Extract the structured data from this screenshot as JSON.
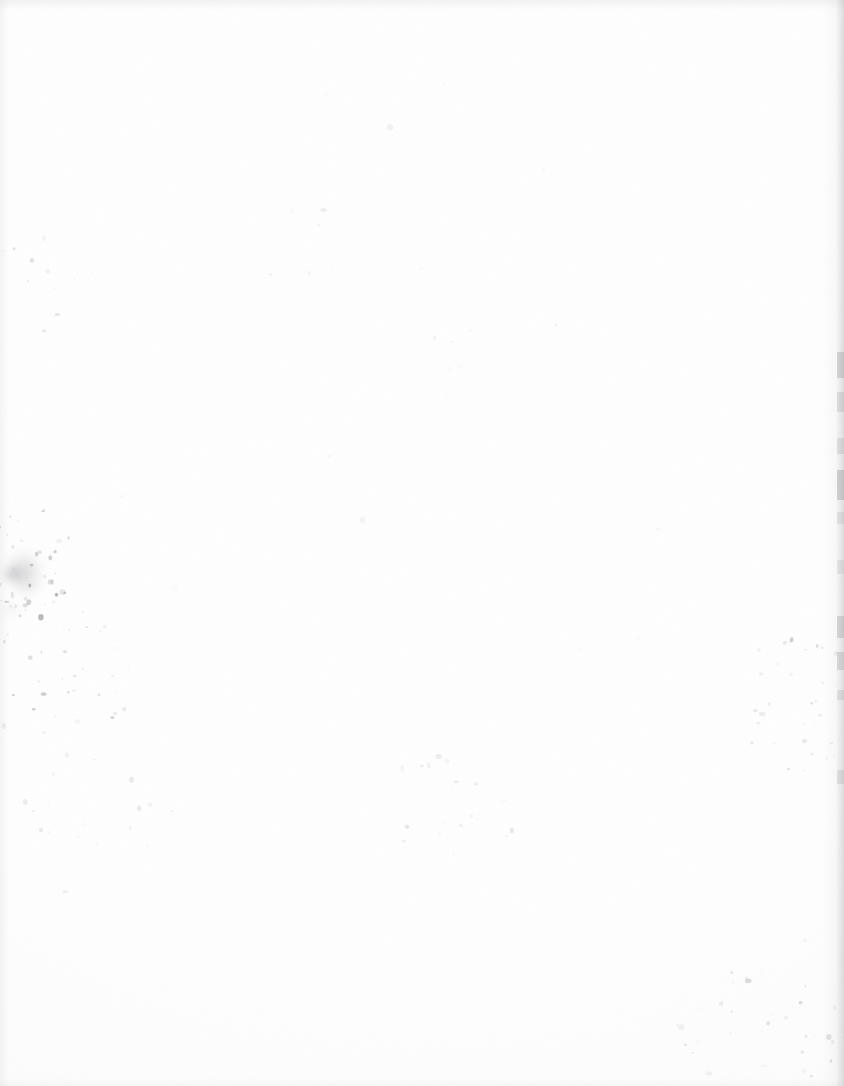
{
  "page": {
    "kind": "blank-scanned-page",
    "width": 844,
    "height": 1086,
    "background_color": "#fdfdfd",
    "paper_color": "#ffffff",
    "text_content": "",
    "visible_text": "none"
  },
  "colors": {
    "paper": "#fdfdfd",
    "edge_shadow": "#8c8c91",
    "speck_dark": "#6c6c72",
    "speck_mid": "#9a9aa0",
    "speck_light": "#c8c8cd",
    "smudge": "#7e7e85",
    "right_strip": "#82828a"
  },
  "edges": {
    "top": {
      "height": 10,
      "opacity": 0.1
    },
    "left": {
      "width": 9,
      "opacity": 0.085
    },
    "bottom": {
      "height": 8,
      "opacity": 0.05
    },
    "right_soft": {
      "width": 22,
      "opacity": 0.09
    },
    "right_strip": {
      "width": 7,
      "opacity": 0.2
    }
  },
  "right_edge_dashes": [
    {
      "y": 352,
      "h": 26,
      "opacity": 0.42
    },
    {
      "y": 392,
      "h": 20,
      "opacity": 0.3
    },
    {
      "y": 438,
      "h": 16,
      "opacity": 0.26
    },
    {
      "y": 470,
      "h": 30,
      "opacity": 0.46
    },
    {
      "y": 512,
      "h": 12,
      "opacity": 0.22
    },
    {
      "y": 560,
      "h": 14,
      "opacity": 0.2
    },
    {
      "y": 616,
      "h": 22,
      "opacity": 0.38
    },
    {
      "y": 652,
      "h": 18,
      "opacity": 0.34
    },
    {
      "y": 690,
      "h": 10,
      "opacity": 0.24
    },
    {
      "y": 770,
      "h": 14,
      "opacity": 0.26
    },
    {
      "y": 1098,
      "h": 10,
      "opacity": 0.18
    }
  ],
  "smudges": [
    {
      "x": 2,
      "y": 548,
      "w": 44,
      "h": 46,
      "opacity": 0.3,
      "blur": 5
    },
    {
      "x": 0,
      "y": 562,
      "w": 26,
      "h": 24,
      "opacity": 0.34,
      "blur": 3
    },
    {
      "x": 10,
      "y": 576,
      "w": 34,
      "h": 20,
      "opacity": 0.16,
      "blur": 6
    },
    {
      "x": 0,
      "y": 600,
      "w": 22,
      "h": 18,
      "opacity": 0.12,
      "blur": 5
    }
  ],
  "dust_clusters": [
    {
      "name": "left-margin-upper",
      "cx": 40,
      "cy": 250,
      "rx": 60,
      "ry": 90,
      "count": 14,
      "opacity": 0.16
    },
    {
      "name": "left-margin-mid",
      "cx": 30,
      "cy": 565,
      "rx": 48,
      "ry": 60,
      "count": 46,
      "opacity": 0.4
    },
    {
      "name": "left-margin-lower",
      "cx": 60,
      "cy": 690,
      "rx": 72,
      "ry": 90,
      "count": 40,
      "opacity": 0.3
    },
    {
      "name": "lower-left-tail",
      "cx": 110,
      "cy": 830,
      "rx": 95,
      "ry": 80,
      "count": 22,
      "opacity": 0.18
    },
    {
      "name": "center-low",
      "cx": 450,
      "cy": 800,
      "rx": 85,
      "ry": 55,
      "count": 24,
      "opacity": 0.15
    },
    {
      "name": "right-mid",
      "cx": 800,
      "cy": 700,
      "rx": 60,
      "ry": 75,
      "count": 34,
      "opacity": 0.26
    },
    {
      "name": "bottom-right",
      "cx": 760,
      "cy": 1010,
      "rx": 95,
      "ry": 80,
      "count": 34,
      "opacity": 0.2
    },
    {
      "name": "upper-scatter",
      "cx": 420,
      "cy": 230,
      "rx": 260,
      "ry": 160,
      "count": 18,
      "opacity": 0.1
    },
    {
      "name": "mid-scatter",
      "cx": 430,
      "cy": 520,
      "rx": 320,
      "ry": 220,
      "count": 20,
      "opacity": 0.09
    }
  ],
  "grain": {
    "base_frequency": 0.85,
    "octaves": 3,
    "opacity": 0.05
  }
}
